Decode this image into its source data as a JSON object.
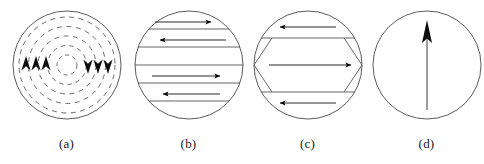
{
  "figure": {
    "width": 484,
    "height": 164,
    "background_color": "#ffffff",
    "stroke_color": "#3a3a3a",
    "arrow_color": "#000000",
    "panel_count": 4
  },
  "panels": [
    {
      "id": "panel-a",
      "label": "(a)",
      "name": "vortex-closure-domain-circle",
      "description": "Circle containing concentric dashed rings with arrowheads pointing up on the left half and down on the right half",
      "circle": {
        "cx": 61,
        "cy": 65,
        "r": 54
      },
      "dashed_rings": [
        48,
        38.5,
        29,
        19.5,
        10
      ],
      "arrowheads": [
        {
          "x": 20,
          "y": 65,
          "direction": "up"
        },
        {
          "x": 30,
          "y": 65,
          "direction": "up"
        },
        {
          "x": 40,
          "y": 65,
          "direction": "up"
        },
        {
          "x": 82,
          "y": 65,
          "direction": "down"
        },
        {
          "x": 92,
          "y": 65,
          "direction": "down"
        },
        {
          "x": 102,
          "y": 65,
          "direction": "down"
        }
      ]
    },
    {
      "id": "panel-b",
      "label": "(b)",
      "name": "stripe-domain-circle",
      "description": "Circle divided by horizontal domain-wall lines with alternating left and right pointing arrows",
      "circle": {
        "cx": 61,
        "cy": 65,
        "r": 54
      },
      "domain_walls_y": [
        29,
        47,
        65,
        83,
        101
      ],
      "arrows": [
        {
          "y": 22,
          "direction": "right"
        },
        {
          "y": 40,
          "direction": "left"
        },
        {
          "y": 76,
          "direction": "right"
        },
        {
          "y": 94,
          "direction": "left"
        }
      ]
    },
    {
      "id": "panel-c",
      "label": "(c)",
      "name": "flux-closure-domain-circle",
      "description": "Circle with hexagonal closure domains: triangular end caps and three horizontal bands with alternating arrows",
      "circle": {
        "cx": 61,
        "cy": 65,
        "r": 54
      },
      "domain_walls_y": [
        38,
        92
      ],
      "arrows": [
        {
          "y": 27,
          "direction": "left"
        },
        {
          "y": 65,
          "direction": "right"
        },
        {
          "y": 103,
          "direction": "left"
        }
      ]
    },
    {
      "id": "panel-d",
      "label": "(d)",
      "name": "single-domain-circle",
      "description": "Circle containing a single large vertical arrow pointing up",
      "circle": {
        "cx": 61,
        "cy": 65,
        "r": 54
      },
      "arrow": {
        "x": 61,
        "y_tail": 110,
        "y_head": 22,
        "direction": "up"
      }
    }
  ]
}
